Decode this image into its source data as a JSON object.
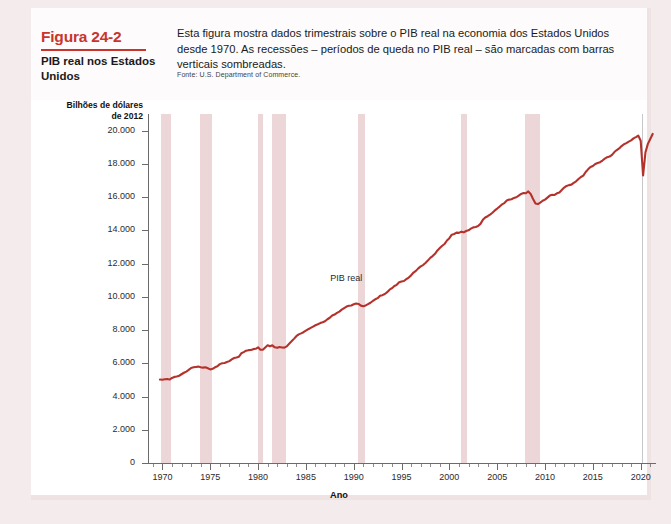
{
  "figure": {
    "number_label": "Figura 24-2",
    "title": "PIB real nos Estados Unidos",
    "description": "Esta figura mostra dados trimestrais sobre o PIB real na economia dos Estados Unidos desde 1970. As recessões – períodos de queda no PIB real – são marcadas com barras verticais sombreadas.",
    "source": "Fonte: U.S. Department of Commerce.",
    "accent_color": "#c9342c",
    "line_color": "#b5322c",
    "band_color": "#e8cbcc"
  },
  "chart_data": {
    "type": "line",
    "title": "PIB real nos Estados Unidos",
    "xlabel": "Ano",
    "ylabel": "Bilhões de dólares de 2012",
    "xlim": [
      1968.6,
      2021.6
    ],
    "ylim": [
      0,
      21000
    ],
    "grid": false,
    "legend": "none",
    "annotations": [
      {
        "text": "PIB real",
        "x": 1989.0,
        "y": 11100
      }
    ],
    "xticks": [
      1970,
      1975,
      1980,
      1985,
      1990,
      1995,
      2000,
      2005,
      2010,
      2015,
      2020
    ],
    "xtick_labels": [
      "1970",
      "1975",
      "1980",
      "1985",
      "1990",
      "1995",
      "2000",
      "2005",
      "2010",
      "2015",
      "2020"
    ],
    "xminor_interval": 1,
    "yticks": [
      0,
      2000,
      4000,
      6000,
      8000,
      10000,
      12000,
      14000,
      16000,
      18000,
      20000
    ],
    "ytick_labels": [
      "0",
      "2.000",
      "4.000",
      "6.000",
      "8.000",
      "10.000",
      "12.000",
      "14.000",
      "16.000",
      "18.000",
      "20.000"
    ],
    "shaded_bands": [
      {
        "label": "Recessão 1969-1970",
        "start": 1969.9,
        "end": 1970.9
      },
      {
        "label": "Recessão 1973-1975",
        "start": 1973.9,
        "end": 1975.2
      },
      {
        "label": "Recessão 1980",
        "start": 1980.0,
        "end": 1980.55
      },
      {
        "label": "Recessão 1981-1982",
        "start": 1981.5,
        "end": 1982.9
      },
      {
        "label": "Recessão 1990-1991",
        "start": 1990.5,
        "end": 1991.2
      },
      {
        "label": "Recessão 2001",
        "start": 2001.2,
        "end": 2001.85
      },
      {
        "label": "Recessão 2007-2009",
        "start": 2007.9,
        "end": 2009.45
      },
      {
        "label": "Recessão 2020",
        "start": 2020.05,
        "end": 2020.25
      }
    ],
    "series": [
      {
        "name": "PIB real",
        "x": [
          1969.75,
          1970.0,
          1970.25,
          1970.5,
          1970.75,
          1971.0,
          1971.25,
          1971.5,
          1971.75,
          1972.0,
          1972.25,
          1972.5,
          1972.75,
          1973.0,
          1973.25,
          1973.5,
          1973.75,
          1974.0,
          1974.25,
          1974.5,
          1974.75,
          1975.0,
          1975.25,
          1975.5,
          1975.75,
          1976.0,
          1976.25,
          1976.5,
          1976.75,
          1977.0,
          1977.25,
          1977.5,
          1977.75,
          1978.0,
          1978.25,
          1978.5,
          1978.75,
          1979.0,
          1979.25,
          1979.5,
          1979.75,
          1980.0,
          1980.25,
          1980.5,
          1980.75,
          1981.0,
          1981.25,
          1981.5,
          1981.75,
          1982.0,
          1982.25,
          1982.5,
          1982.75,
          1983.0,
          1983.25,
          1983.5,
          1983.75,
          1984.0,
          1984.25,
          1984.5,
          1984.75,
          1985.0,
          1985.25,
          1985.5,
          1985.75,
          1986.0,
          1986.25,
          1986.5,
          1986.75,
          1987.0,
          1987.25,
          1987.5,
          1987.75,
          1988.0,
          1988.25,
          1988.5,
          1988.75,
          1989.0,
          1989.25,
          1989.5,
          1989.75,
          1990.0,
          1990.25,
          1990.5,
          1990.75,
          1991.0,
          1991.25,
          1991.5,
          1991.75,
          1992.0,
          1992.25,
          1992.5,
          1992.75,
          1993.0,
          1993.25,
          1993.5,
          1993.75,
          1994.0,
          1994.25,
          1994.5,
          1994.75,
          1995.0,
          1995.25,
          1995.5,
          1995.75,
          1996.0,
          1996.25,
          1996.5,
          1996.75,
          1997.0,
          1997.25,
          1997.5,
          1997.75,
          1998.0,
          1998.25,
          1998.5,
          1998.75,
          1999.0,
          1999.25,
          1999.5,
          1999.75,
          2000.0,
          2000.25,
          2000.5,
          2000.75,
          2001.0,
          2001.25,
          2001.5,
          2001.75,
          2002.0,
          2002.25,
          2002.5,
          2002.75,
          2003.0,
          2003.25,
          2003.5,
          2003.75,
          2004.0,
          2004.25,
          2004.5,
          2004.75,
          2005.0,
          2005.25,
          2005.5,
          2005.75,
          2006.0,
          2006.25,
          2006.5,
          2006.75,
          2007.0,
          2007.25,
          2007.5,
          2007.75,
          2008.0,
          2008.25,
          2008.5,
          2008.75,
          2009.0,
          2009.25,
          2009.5,
          2009.75,
          2010.0,
          2010.25,
          2010.5,
          2010.75,
          2011.0,
          2011.25,
          2011.5,
          2011.75,
          2012.0,
          2012.25,
          2012.5,
          2012.75,
          2013.0,
          2013.25,
          2013.5,
          2013.75,
          2014.0,
          2014.25,
          2014.5,
          2014.75,
          2015.0,
          2015.25,
          2015.5,
          2015.75,
          2016.0,
          2016.25,
          2016.5,
          2016.75,
          2017.0,
          2017.25,
          2017.5,
          2017.75,
          2018.0,
          2018.25,
          2018.5,
          2018.75,
          2019.0,
          2019.25,
          2019.5,
          2019.75,
          2020.0,
          2020.25,
          2020.5,
          2020.75,
          2021.0,
          2021.25
        ],
        "y": [
          5020,
          5010,
          5035,
          5050,
          5020,
          5120,
          5180,
          5200,
          5250,
          5340,
          5430,
          5500,
          5600,
          5720,
          5760,
          5780,
          5800,
          5760,
          5740,
          5760,
          5700,
          5630,
          5670,
          5760,
          5820,
          5950,
          6000,
          6020,
          6080,
          6130,
          6240,
          6320,
          6350,
          6400,
          6600,
          6670,
          6760,
          6790,
          6800,
          6850,
          6870,
          6960,
          6810,
          6820,
          6950,
          7080,
          7020,
          7080,
          6960,
          6930,
          6980,
          6950,
          6940,
          7020,
          7180,
          7320,
          7470,
          7630,
          7740,
          7800,
          7870,
          7960,
          8050,
          8130,
          8210,
          8290,
          8350,
          8420,
          8470,
          8530,
          8650,
          8740,
          8870,
          8930,
          9030,
          9110,
          9230,
          9320,
          9410,
          9460,
          9480,
          9550,
          9600,
          9570,
          9470,
          9430,
          9480,
          9560,
          9640,
          9750,
          9850,
          9920,
          10060,
          10100,
          10170,
          10280,
          10430,
          10520,
          10650,
          10720,
          10870,
          10920,
          10950,
          11060,
          11160,
          11290,
          11460,
          11560,
          11710,
          11830,
          11910,
          12040,
          12180,
          12340,
          12450,
          12590,
          12790,
          12930,
          13070,
          13180,
          13390,
          13530,
          13740,
          13780,
          13860,
          13850,
          13920,
          13880,
          13960,
          14000,
          14100,
          14180,
          14200,
          14260,
          14390,
          14630,
          14770,
          14850,
          14950,
          15060,
          15200,
          15310,
          15430,
          15560,
          15640,
          15790,
          15850,
          15870,
          15950,
          15990,
          16090,
          16190,
          16240,
          16230,
          16340,
          16190,
          15890,
          15620,
          15580,
          15670,
          15780,
          15850,
          15970,
          16090,
          16140,
          16130,
          16230,
          16280,
          16430,
          16570,
          16670,
          16720,
          16750,
          16860,
          16950,
          17090,
          17210,
          17290,
          17510,
          17670,
          17810,
          17870,
          17990,
          18050,
          18100,
          18200,
          18310,
          18400,
          18440,
          18540,
          18710,
          18830,
          18930,
          19070,
          19180,
          19250,
          19340,
          19410,
          19530,
          19610,
          19700,
          19390,
          17300,
          18700,
          19200,
          19500,
          19800
        ]
      }
    ]
  }
}
